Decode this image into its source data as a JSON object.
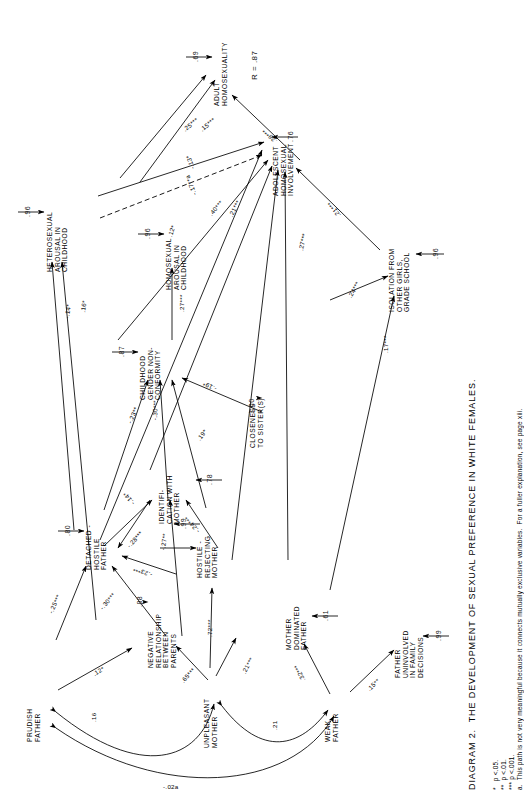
{
  "figure": {
    "caption": "DIAGRAM 2.  THE DEVELOPMENT OF SEXUAL PREFERENCE IN WHITE FEMALES.",
    "r_label": "R = .87"
  },
  "footnotes": [
    "*   p <.05.",
    "**  p <.01.",
    "*** p <.001.",
    "a.  This path is not very meaningful because it connects mutually exclusive variables.  For a fuller explanation, see page xiii."
  ],
  "nodes": [
    {
      "id": "adult_homosexuality",
      "label": "ADULT\nHOMOSEXUALITY"
    },
    {
      "id": "adolescent_involvement",
      "label": "ADOLESCENT\nHOMOSEXUAL\nINVOLVEMENT"
    },
    {
      "id": "hetero_arousal",
      "label": "HETEROSEXUAL\nAROUSAL IN\nCHILDHOOD"
    },
    {
      "id": "homo_arousal",
      "label": "HOMOSEXUAL\nAROUSAL IN\nCHILDHOOD"
    },
    {
      "id": "gender_nonconformity",
      "label": "CHILDHOOD\nGENDER NON-\nCONFORMITY"
    },
    {
      "id": "isolation",
      "label": "ISOLATION FROM\nOTHER GIRLS,\nGRADE SCHOOL"
    },
    {
      "id": "closeness_sisters",
      "label": "CLOSENESS\nTO SISTER(S)"
    },
    {
      "id": "identification_mother",
      "label": "IDENTIFI-\nCATION WITH\nMOTHER"
    },
    {
      "id": "hostile_mother",
      "label": "HOSTILE -\nREJECTING\nMOTHER"
    },
    {
      "id": "detached_father",
      "label": "DETACHED -\nHOSTILE\nFATHER"
    },
    {
      "id": "mother_dominated",
      "label": "MOTHER\nDOMINATED\nFATHER"
    },
    {
      "id": "father_uninvolved",
      "label": "FATHER\nUNINVOLVED\nIN FAMILY\nDECISIONS"
    },
    {
      "id": "negative_relationship",
      "label": "NEGATIVE\nRELATIONSHIP\nBETWEEN\nPARENTS"
    },
    {
      "id": "prudish_father",
      "label": "PRUDISH\nFATHER"
    },
    {
      "id": "unpleasant_mother",
      "label": "UNPLEASANT\nMOTHER"
    },
    {
      "id": "weak_father",
      "label": "WEAK\nFATHER"
    }
  ],
  "residuals": [
    {
      "id": "res_adult",
      "value": ".69"
    },
    {
      "id": "res_adolescent",
      "value": ".76"
    },
    {
      "id": "res_hetero",
      "value": ".96"
    },
    {
      "id": "res_homo",
      "value": ".96"
    },
    {
      "id": "res_gender",
      "value": ".87"
    },
    {
      "id": "res_isolation",
      "value": ".96"
    },
    {
      "id": "res_closeness",
      "value": "1.00"
    },
    {
      "id": "res_identif",
      "value": ".78"
    },
    {
      "id": "res_hostile_mom",
      "value": ".99"
    },
    {
      "id": "res_detached",
      "value": ".80"
    },
    {
      "id": "res_mom_dom",
      "value": ".61"
    },
    {
      "id": "res_father_unin",
      "value": ".99"
    },
    {
      "id": "res_neg_rel",
      "value": ".88"
    }
  ],
  "coefficients": [
    {
      "id": "c_adol_adult",
      "value": ".25***"
    },
    {
      "id": "c_homo_adult",
      "value": ".15***"
    },
    {
      "id": "c_gender_adult",
      "value": ".28***"
    },
    {
      "id": "c_hetero_adol",
      "value": "-.13*"
    },
    {
      "id": "c_homoar_adol",
      "value": "-.17**a"
    },
    {
      "id": "c_gender_adol",
      "value": ".40***"
    },
    {
      "id": "c_ident_adol",
      "value": ".21***"
    },
    {
      "id": "c_closeness_adol",
      "value": ".27***"
    },
    {
      "id": "c_isolation_adol",
      "value": ".21***"
    },
    {
      "id": "c_detached_adol",
      "value": ".12*"
    },
    {
      "id": "c_hetero_a",
      "value": "-.14*"
    },
    {
      "id": "c_hetero_b",
      "value": ".16*"
    },
    {
      "id": "c_gender_homo",
      "value": ".27***"
    },
    {
      "id": "c_detach_gender",
      "value": "-.23**"
    },
    {
      "id": "c_ident_gender",
      "value": "-.30***"
    },
    {
      "id": "c_hostmom_gender",
      "value": "-.19*"
    },
    {
      "id": "c_closeness_gender",
      "value": ".19*"
    },
    {
      "id": "c_gender_isolation",
      "value": ".24***"
    },
    {
      "id": "c_momdom_isolation",
      "value": ".17***"
    },
    {
      "id": "c_detach_ident",
      "value": "-.28***"
    },
    {
      "id": "c_unpleas_ident",
      "value": "-.27**"
    },
    {
      "id": "c_hostmom_ident",
      "value": "-.24***"
    },
    {
      "id": "c_detach_a",
      "value": "-.25***"
    },
    {
      "id": "c_detach_b",
      "value": "-.30***"
    },
    {
      "id": "c_detach_c",
      "value": "-.14*"
    },
    {
      "id": "c_detach_d",
      "value": "-.23***"
    },
    {
      "id": "c_prudish_detach",
      "value": ".12*"
    },
    {
      "id": "c_unpleas_negrel",
      "value": ".65***"
    },
    {
      "id": "c_unpleas_momdom",
      "value": ".72***"
    },
    {
      "id": "c_unpleas_momdom2",
      "value": ".21***"
    },
    {
      "id": "c_weak_momdom",
      "value": ".32***"
    },
    {
      "id": "c_weak_fatherunin",
      "value": ".15**"
    },
    {
      "id": "c_unpleas_weak",
      "value": "-.02a"
    },
    {
      "id": "c_corr_prud_unpl",
      "value": ".16"
    },
    {
      "id": "c_corr_prud_weak",
      "value": "-.02"
    },
    {
      "id": "c_corr_unpl_weak",
      "value": ".21"
    }
  ]
}
